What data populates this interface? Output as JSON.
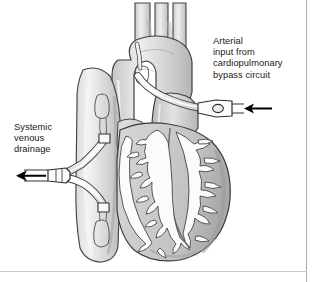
{
  "figure": {
    "width": 320,
    "height": 282,
    "background_color": "#ffffff"
  },
  "labels": {
    "arterial": {
      "name": "arterial-input-label",
      "lines": [
        "Arterial",
        "input from",
        "cardiopulmonary",
        "bypass circuit"
      ],
      "text_color": "#1a1a1a",
      "position": "top-right"
    },
    "venous": {
      "name": "systemic-venous-drainage-label",
      "lines": [
        "Systemic",
        "venous",
        "drainage"
      ],
      "text_color": "#1a1a1a",
      "position": "middle-left"
    }
  },
  "annotations": {
    "arterial_arrow": {
      "icon": "arrow-left-icon",
      "direction": "left",
      "color": "#000000",
      "meaning": "blood flowing into the aorta from the bypass circuit"
    },
    "venous_arrow": {
      "icon": "arrow-left-icon",
      "direction": "left",
      "color": "#000000",
      "meaning": "blood draining out of the vena cavae to the bypass circuit"
    }
  },
  "anatomy": {
    "great_vessels": [
      "brachiocephalic trunk",
      "left common carotid artery",
      "left subclavian artery"
    ],
    "structures": [
      "aortic arch",
      "ascending aorta",
      "pulmonary trunk",
      "superior vena cava",
      "inferior vena cava",
      "right atrium",
      "right ventricle",
      "left ventricle",
      "coronary arteries"
    ]
  },
  "cannulas": {
    "arterial": {
      "name": "aortic-cannula",
      "insertion_site": "ascending aorta",
      "has_connector": true
    },
    "venous_superior": {
      "name": "superior-vena-cava-cannula",
      "insertion_site": "superior vena cava",
      "has_purse_string_suture": true
    },
    "venous_inferior": {
      "name": "inferior-vena-cava-cannula",
      "insertion_site": "inferior vena cava",
      "has_purse_string_suture": true
    },
    "venous_connector": {
      "name": "y-connector",
      "joins": "both venous cannulas into a single drainage line"
    }
  },
  "palette": {
    "outline": "#3c3c3c",
    "myocardium_light": "#e8e8e8",
    "myocardium_mid": "#cfcfcf",
    "myocardium_dark": "#b0b0b0",
    "vessel_light": "#ededed",
    "vessel_shadow": "#bdbdbd",
    "cannula_fill": "#fafafa",
    "arrow": "#000000",
    "frame_line": "#adadad"
  }
}
